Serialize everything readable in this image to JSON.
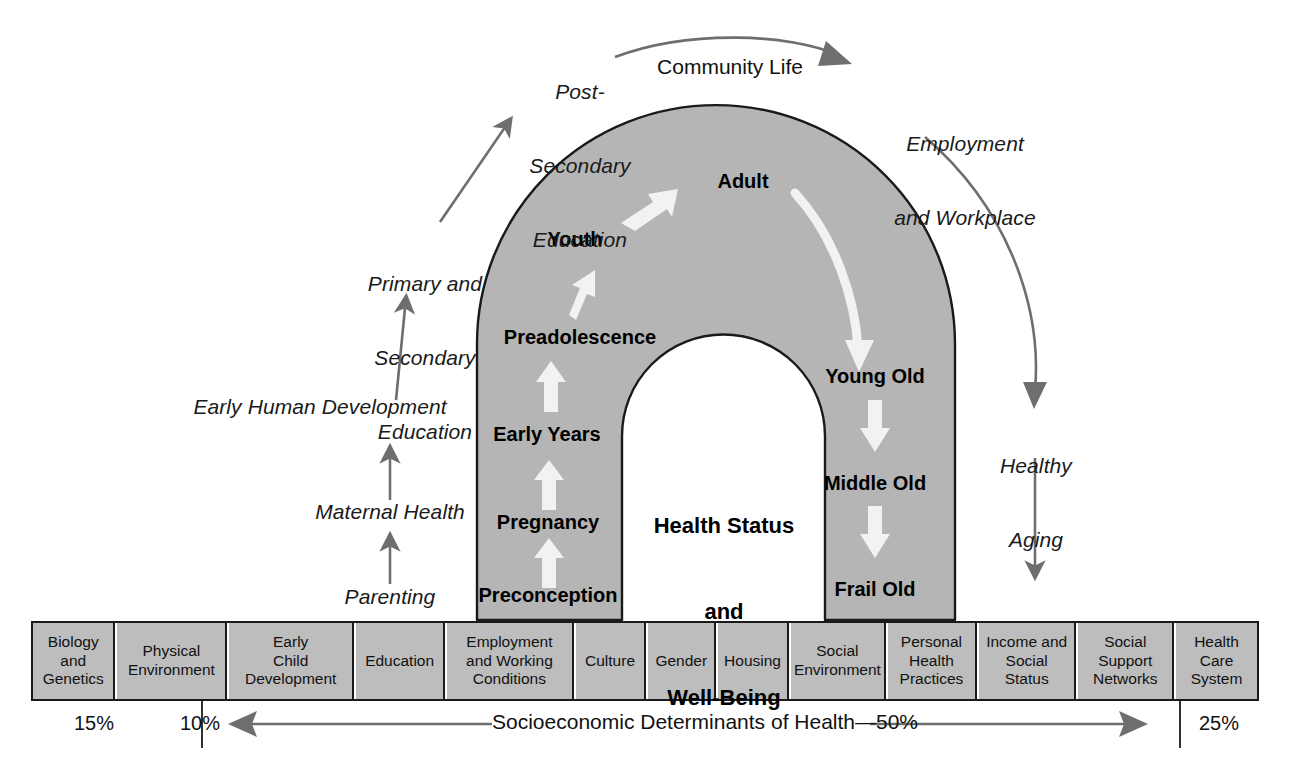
{
  "diagram": {
    "colors": {
      "arch_fill": "#b5b5b5",
      "arch_stroke": "#1a1a1a",
      "box_fill": "#bdbdbd",
      "box_stroke": "#1a1a1a",
      "white_arrow": "#f2f2f2",
      "gray_arrow": "#6e6e6e",
      "text": "#111111"
    }
  },
  "arch": {
    "center_label": "Health Status\nand\nWell-Being",
    "center_lines": [
      "Health Status",
      "and",
      "Well-Being"
    ],
    "ascending_stages": [
      "Preconception",
      "Pregnancy",
      "Early Years",
      "Preadolescence",
      "Youth",
      "Adult"
    ],
    "descending_stages": [
      "Young Old",
      "Middle Old",
      "Frail Old"
    ]
  },
  "outer_labels": {
    "left": [
      {
        "text": "Parenting",
        "lines": [
          "Parenting"
        ]
      },
      {
        "text": "Maternal Health",
        "lines": [
          "Maternal Health"
        ]
      },
      {
        "text": "Early Human Development",
        "lines": [
          "Early Human Development"
        ]
      },
      {
        "text": "Primary and Secondary Education",
        "lines": [
          "Primary and",
          "Secondary",
          "Education"
        ]
      },
      {
        "text": "Post-Secondary Education",
        "lines": [
          "Post-",
          "Secondary",
          "Education"
        ]
      }
    ],
    "top": {
      "text": "Community Life"
    },
    "right": [
      {
        "text": "Employment and Workplace",
        "lines": [
          "Employment",
          "and Workplace"
        ]
      },
      {
        "text": "Healthy Aging",
        "lines": [
          "Healthy",
          "Aging"
        ]
      }
    ]
  },
  "determinants": {
    "cells": [
      {
        "lines": [
          "Biology",
          "and",
          "Genetics"
        ],
        "text": "Biology and Genetics"
      },
      {
        "lines": [
          "Physical",
          "Environment"
        ],
        "text": "Physical Environment"
      },
      {
        "lines": [
          "Early",
          "Child",
          "Development"
        ],
        "text": "Early Child Development"
      },
      {
        "lines": [
          "Education"
        ],
        "text": "Education"
      },
      {
        "lines": [
          "Employment",
          "and Working",
          "Conditions"
        ],
        "text": "Employment and Working Conditions"
      },
      {
        "lines": [
          "Culture"
        ],
        "text": "Culture"
      },
      {
        "lines": [
          "Gender"
        ],
        "text": "Gender"
      },
      {
        "lines": [
          "Housing"
        ],
        "text": "Housing"
      },
      {
        "lines": [
          "Social",
          "Environment"
        ],
        "text": "Social Environment"
      },
      {
        "lines": [
          "Personal",
          "Health",
          "Practices"
        ],
        "text": "Personal Health Practices"
      },
      {
        "lines": [
          "Income and",
          "Social",
          "Status"
        ],
        "text": "Income and Social Status"
      },
      {
        "lines": [
          "Social",
          "Support",
          "Networks"
        ],
        "text": "Social Support Networks"
      },
      {
        "lines": [
          "Health",
          "Care",
          "System"
        ],
        "text": "Health Care System"
      }
    ]
  },
  "footer": {
    "pct_biology": "15%",
    "pct_physical": "10%",
    "band_label": "Socioeconomic Determinants of Health—50%",
    "pct_health_care": "25%"
  },
  "chart_data": {
    "type": "bar",
    "categories": [
      "Biology and Genetics",
      "Physical Environment",
      "Socioeconomic Determinants of Health",
      "Health Care System"
    ],
    "values": [
      15,
      10,
      50,
      25
    ],
    "unit": "%",
    "xlabel": "",
    "ylabel": "Share of health outcomes (%)",
    "ylim": [
      0,
      100
    ]
  }
}
